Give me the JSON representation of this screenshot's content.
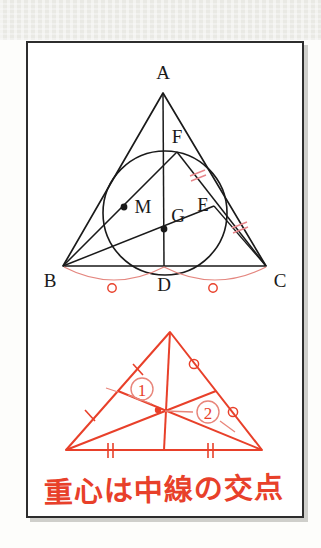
{
  "figure": {
    "title_text": "重心は中線の交点",
    "colors": {
      "ink_black": "#1a1a1a",
      "ink_red": "#e8402a",
      "frame": "#2d2d2d",
      "paper": "#ffffff",
      "margin_band": "#e9e9e4"
    },
    "upper_diagram": {
      "label": "triangle-with-circumscribed-circle-and-medians",
      "vertices": [
        {
          "name": "A",
          "label": "A",
          "x": 163,
          "y": 93,
          "label_x": 163,
          "label_y": 75
        },
        {
          "name": "B",
          "label": "B",
          "x": 63,
          "y": 266,
          "label_x": 51,
          "label_y": 284
        },
        {
          "name": "C",
          "label": "C",
          "x": 266,
          "y": 266,
          "label_x": 278,
          "label_y": 284
        }
      ],
      "midpoints": [
        {
          "name": "D",
          "label": "D",
          "x": 164,
          "y": 266,
          "label_x": 164,
          "label_y": 287
        },
        {
          "name": "E",
          "label": "E",
          "x": 214,
          "y": 206,
          "label_x": 202,
          "label_y": 203
        },
        {
          "name": "F",
          "label": "F",
          "x": 177,
          "y": 152,
          "label_x": 177,
          "label_y": 137
        }
      ],
      "interior_points": [
        {
          "name": "M",
          "label": "M",
          "x": 124,
          "y": 207,
          "label_x": 143,
          "label_y": 206,
          "dot": true
        },
        {
          "name": "G",
          "label": "G",
          "x": 164,
          "y": 229,
          "label_x": 178,
          "label_y": 214,
          "dot": true
        }
      ],
      "circle": {
        "cx": 165,
        "cy": 213,
        "r": 62
      },
      "tick_marks_double": [
        {
          "on": "A-E",
          "count": 2
        },
        {
          "on": "E-C",
          "count": 2
        }
      ],
      "arc_marks": [
        {
          "on": "B-D",
          "symbol": "circle"
        },
        {
          "on": "D-C",
          "symbol": "circle"
        }
      ]
    },
    "lower_diagram": {
      "label": "red-triangle-with-medians-and-numbered-regions",
      "vertices": [
        {
          "name": "apex",
          "x": 170,
          "y": 332
        },
        {
          "name": "left",
          "x": 66,
          "y": 450
        },
        {
          "name": "right",
          "x": 262,
          "y": 450
        }
      ],
      "centroid": {
        "x": 158,
        "y": 410
      },
      "midpoints": [
        {
          "name": "base-mid",
          "x": 164,
          "y": 450
        },
        {
          "name": "left-mid",
          "x": 118,
          "y": 391
        },
        {
          "name": "right-mid",
          "x": 216,
          "y": 391
        }
      ],
      "region_labels": [
        {
          "id": "1",
          "text": "①",
          "x": 141,
          "y": 389
        },
        {
          "id": "2",
          "text": "②",
          "x": 207,
          "y": 412
        }
      ],
      "tick_marks": [
        {
          "on": "left-side-upper",
          "count": 1
        },
        {
          "on": "left-side-lower",
          "count": 1
        },
        {
          "on": "base-left-half",
          "count": 2
        },
        {
          "on": "base-right-half",
          "count": 2
        }
      ],
      "circle_marks": [
        {
          "on": "right-side-upper",
          "symbol": "circle"
        },
        {
          "on": "right-side-lower",
          "symbol": "circle"
        }
      ]
    }
  }
}
